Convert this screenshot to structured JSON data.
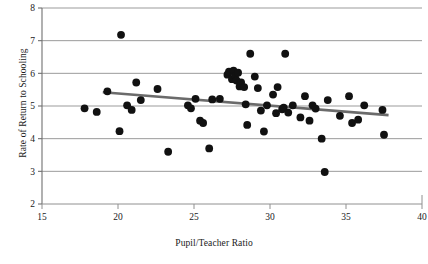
{
  "chart_data": {
    "type": "scatter",
    "title": "",
    "xlabel": "Pupil/Teacher Ratio",
    "ylabel": "Rate of Return to Schooling",
    "xlim": [
      15,
      40
    ],
    "ylim": [
      2,
      8
    ],
    "xticks": [
      15,
      20,
      25,
      30,
      35,
      40
    ],
    "yticks": [
      2,
      3,
      4,
      5,
      6,
      7,
      8
    ],
    "xtick_labels": [
      "15",
      "20",
      "25",
      "30",
      "35",
      "40"
    ],
    "ytick_labels": [
      "2",
      "3",
      "4",
      "5",
      "6",
      "7",
      "8"
    ],
    "grid": "horizontal",
    "legend": "none",
    "marker_color": "#111111",
    "marker_size": 5.2,
    "points": [
      [
        17.8,
        4.93
      ],
      [
        18.6,
        4.82
      ],
      [
        19.3,
        5.45
      ],
      [
        20.2,
        7.18
      ],
      [
        20.1,
        4.23
      ],
      [
        20.6,
        5.02
      ],
      [
        20.9,
        4.88
      ],
      [
        21.2,
        5.72
      ],
      [
        21.5,
        5.18
      ],
      [
        22.6,
        5.52
      ],
      [
        23.3,
        3.6
      ],
      [
        24.6,
        5.02
      ],
      [
        24.8,
        4.93
      ],
      [
        25.1,
        5.22
      ],
      [
        25.4,
        4.55
      ],
      [
        25.6,
        4.48
      ],
      [
        26.0,
        3.7
      ],
      [
        26.2,
        5.2
      ],
      [
        26.7,
        5.22
      ],
      [
        27.2,
        5.96
      ],
      [
        27.3,
        6.05
      ],
      [
        27.5,
        5.82
      ],
      [
        27.6,
        6.08
      ],
      [
        27.7,
        5.92
      ],
      [
        27.8,
        5.78
      ],
      [
        27.9,
        6.02
      ],
      [
        28.0,
        5.6
      ],
      [
        28.1,
        5.72
      ],
      [
        28.3,
        5.58
      ],
      [
        28.4,
        5.05
      ],
      [
        28.5,
        4.42
      ],
      [
        28.7,
        6.6
      ],
      [
        29.0,
        5.9
      ],
      [
        29.2,
        5.55
      ],
      [
        29.4,
        4.86
      ],
      [
        29.6,
        4.22
      ],
      [
        29.8,
        5.02
      ],
      [
        30.2,
        5.35
      ],
      [
        30.4,
        4.78
      ],
      [
        30.5,
        5.58
      ],
      [
        30.8,
        4.9
      ],
      [
        30.9,
        4.95
      ],
      [
        31.0,
        6.6
      ],
      [
        31.2,
        4.8
      ],
      [
        31.5,
        5.02
      ],
      [
        32.0,
        4.65
      ],
      [
        32.3,
        5.3
      ],
      [
        32.6,
        4.55
      ],
      [
        32.8,
        5.02
      ],
      [
        33.0,
        4.92
      ],
      [
        33.4,
        4.0
      ],
      [
        33.6,
        2.98
      ],
      [
        33.8,
        5.18
      ],
      [
        34.6,
        4.7
      ],
      [
        35.2,
        5.3
      ],
      [
        35.4,
        4.48
      ],
      [
        35.8,
        4.58
      ],
      [
        36.2,
        5.02
      ],
      [
        37.4,
        4.88
      ],
      [
        37.5,
        4.12
      ]
    ],
    "trendline": {
      "color": "#6b6b6b",
      "width": 2.6,
      "x_start": 19.0,
      "y_start": 5.42,
      "x_end": 37.8,
      "y_end": 4.72
    }
  }
}
